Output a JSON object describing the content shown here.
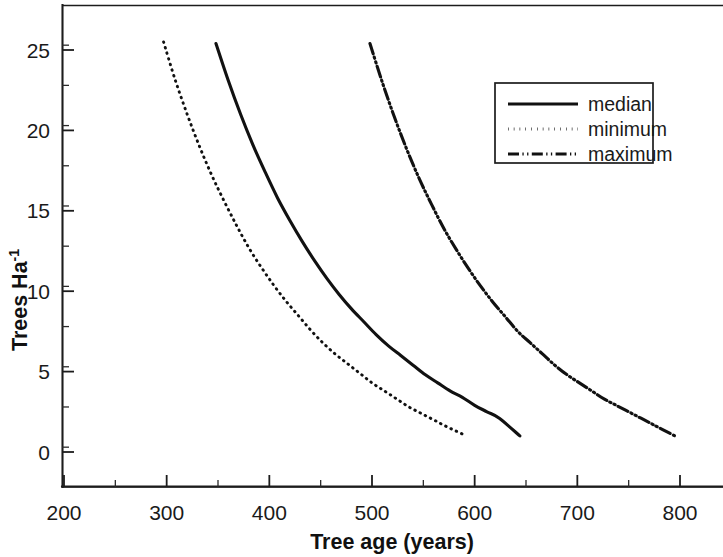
{
  "chart_data": {
    "type": "line",
    "title": "",
    "xlabel": "Tree age (years)",
    "ylabel": "Trees Ha-1",
    "ylabel_base": "Trees Ha",
    "ylabel_exponent": "-1",
    "xlim": [
      200,
      845
    ],
    "ylim": [
      -2.2,
      27.5
    ],
    "xticks": [
      200,
      300,
      400,
      500,
      600,
      700,
      800
    ],
    "yticks": [
      0,
      5,
      10,
      15,
      20,
      25
    ],
    "xtick_labels": [
      "200",
      "300",
      "400",
      "500",
      "600",
      "700",
      "800"
    ],
    "ytick_labels": [
      "0",
      "5",
      "10",
      "15",
      "20",
      "25"
    ],
    "xminor_interval": 50,
    "yminor_interval": 2.5,
    "grid": false,
    "legend_position": "upper right",
    "legend_entries": [
      "median",
      "minimum",
      "maximum"
    ],
    "series": [
      {
        "name": "median",
        "style": "solid",
        "x": [
          348,
          360,
          372,
          384,
          396,
          408,
          420,
          432,
          444,
          456,
          468,
          480,
          492,
          504,
          516,
          528,
          540,
          552,
          564,
          576,
          588,
          600,
          612,
          624,
          644
        ],
        "values": [
          25.4,
          23.1,
          21.0,
          19.1,
          17.4,
          15.8,
          14.4,
          13.1,
          11.9,
          10.8,
          9.8,
          8.9,
          8.1,
          7.3,
          6.6,
          6.0,
          5.4,
          4.8,
          4.3,
          3.8,
          3.4,
          2.9,
          2.5,
          2.1,
          1.0
        ]
      },
      {
        "name": "minimum",
        "style": "dotted",
        "x": [
          297,
          308,
          320,
          332,
          344,
          356,
          368,
          380,
          392,
          404,
          416,
          428,
          440,
          452,
          464,
          476,
          488,
          500,
          512,
          524,
          536,
          548,
          560,
          572,
          592
        ],
        "values": [
          25.5,
          23.2,
          21.0,
          19.0,
          17.2,
          15.6,
          14.1,
          12.7,
          11.5,
          10.4,
          9.4,
          8.5,
          7.6,
          6.8,
          6.1,
          5.5,
          4.9,
          4.3,
          3.8,
          3.3,
          2.8,
          2.4,
          2.0,
          1.6,
          1.0
        ]
      },
      {
        "name": "maximum",
        "style": "dash-dot-dot",
        "x": [
          498,
          510,
          522,
          534,
          546,
          558,
          570,
          582,
          594,
          606,
          618,
          630,
          642,
          654,
          666,
          678,
          690,
          702,
          714,
          726,
          738,
          750,
          762,
          774,
          795
        ],
        "values": [
          25.4,
          23.0,
          20.8,
          18.8,
          17.0,
          15.4,
          13.9,
          12.6,
          11.4,
          10.3,
          9.3,
          8.4,
          7.5,
          6.8,
          6.1,
          5.4,
          4.8,
          4.3,
          3.8,
          3.3,
          2.9,
          2.5,
          2.1,
          1.7,
          1.0
        ]
      }
    ],
    "colors": {
      "axis": "#1c1c1c",
      "series": "#111111",
      "background": "#ffffff"
    }
  }
}
